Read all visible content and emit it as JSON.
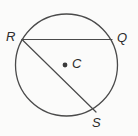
{
  "diagram": {
    "kind": "circle-geometry-diagram",
    "background_color": "#fbfbfa",
    "stroke_color": "#4a4a4a",
    "label_color": "#2b2b2b",
    "circle": {
      "name": "circle-C",
      "center_x": 66.5,
      "center_y": 65,
      "radius": 51,
      "stroke_width": 1.3
    },
    "center_point": {
      "name": "center-point-C",
      "x": 65,
      "y": 65,
      "radius": 2.4,
      "fill": "#3a3a3a"
    },
    "points": [
      {
        "id": "R",
        "label": "R",
        "x": 22,
        "y": 39.5
      },
      {
        "id": "Q",
        "label": "Q",
        "x": 112,
        "y": 39.5
      },
      {
        "id": "S",
        "label": "S",
        "x": 96,
        "y": 112
      },
      {
        "id": "C",
        "label": "C",
        "x": 65,
        "y": 65
      }
    ],
    "segments": [
      {
        "id": "RQ",
        "from": "R",
        "to": "Q",
        "x1": 22,
        "y1": 39.5,
        "x2": 112,
        "y2": 39.5
      },
      {
        "id": "RS",
        "from": "R",
        "to": "S",
        "x1": 22,
        "y1": 39.5,
        "x2": 96,
        "y2": 112
      }
    ],
    "labels": {
      "R": "R",
      "Q": "Q",
      "C": "C",
      "S": "S"
    }
  }
}
